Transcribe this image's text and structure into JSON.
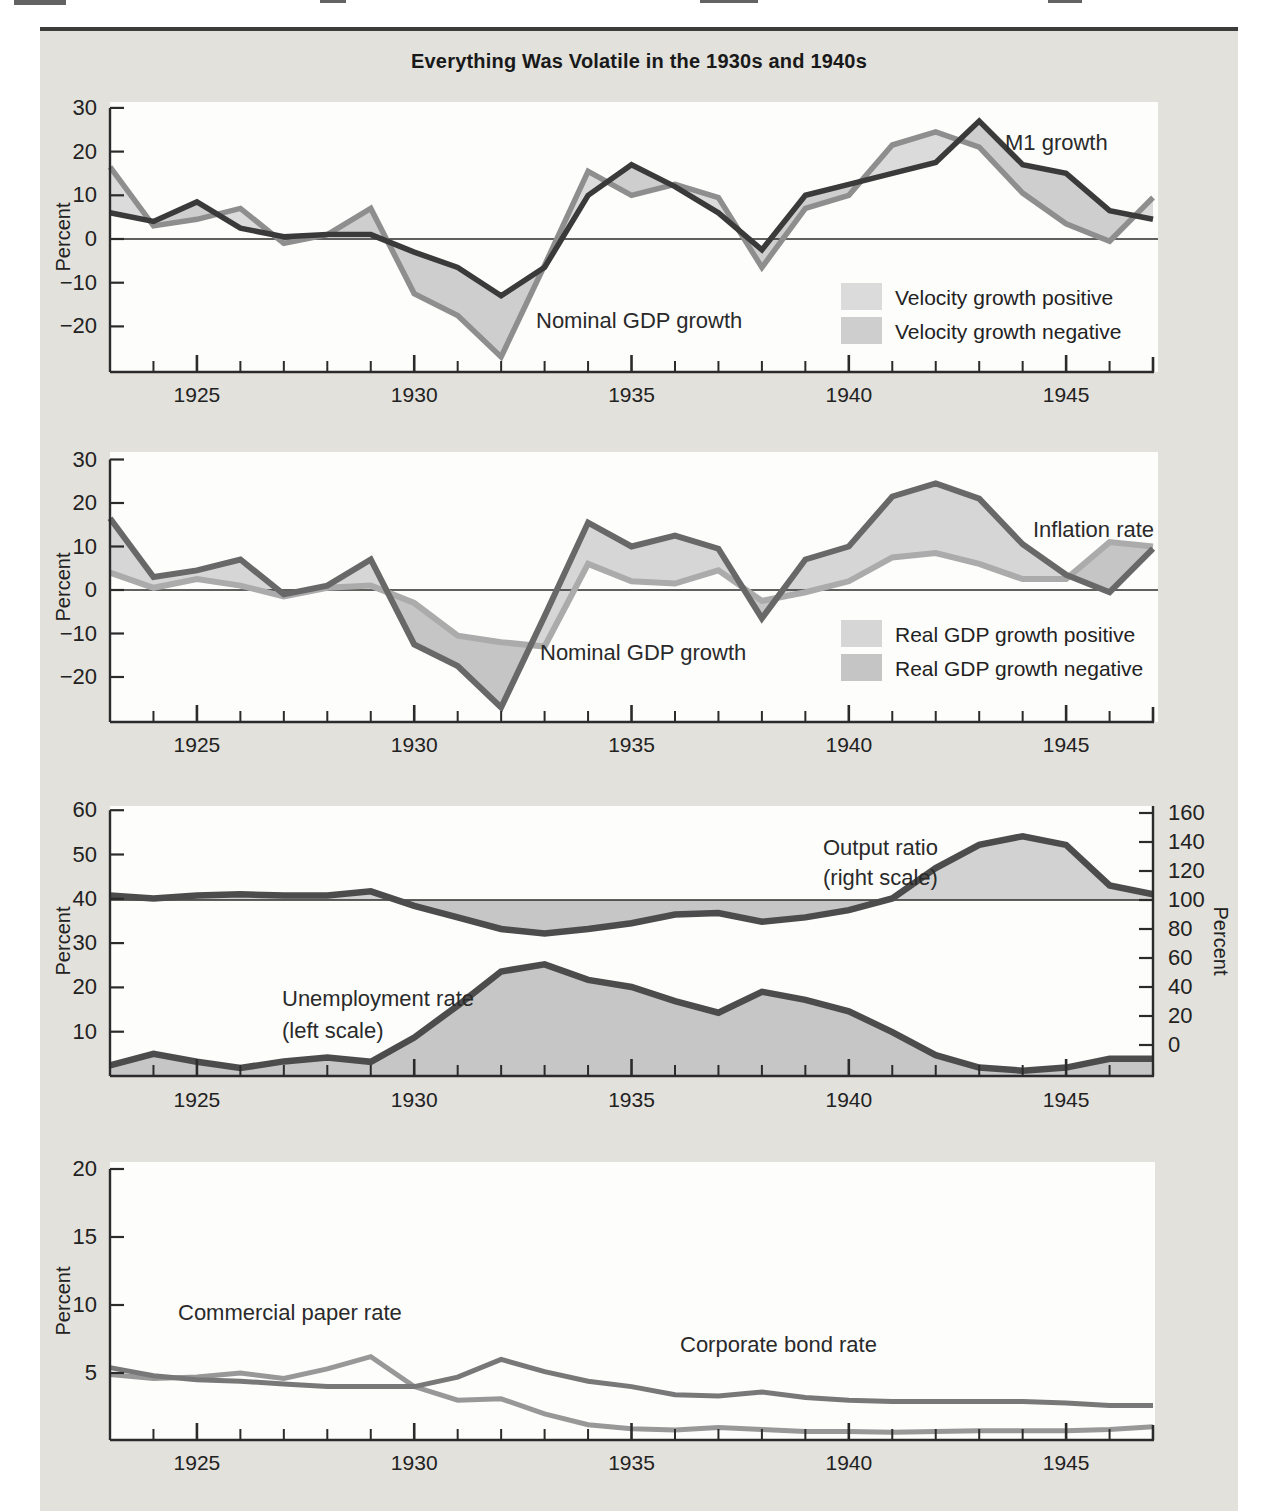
{
  "figure": {
    "title": "Everything Was Volatile in the 1930s and 1940s"
  },
  "chart_data": [
    {
      "id": "money_and_velocity",
      "type": "line",
      "ylabel": "Percent",
      "ylim": [
        -30,
        32
      ],
      "grid": false,
      "x": [
        1923,
        1924,
        1925,
        1926,
        1927,
        1928,
        1929,
        1930,
        1931,
        1932,
        1933,
        1934,
        1935,
        1936,
        1937,
        1938,
        1939,
        1940,
        1941,
        1942,
        1943,
        1944,
        1945,
        1946,
        1947
      ],
      "x_major_ticks": [
        1925,
        1930,
        1935,
        1940,
        1945
      ],
      "x_tick_labels": [
        "1925",
        "1930",
        "1935",
        "1940",
        "1945"
      ],
      "y_ticks": [
        30,
        20,
        10,
        0,
        -10,
        -20
      ],
      "y_tick_labels": [
        "30",
        "20",
        "10",
        "0",
        "−10",
        "−20"
      ],
      "series": [
        {
          "name": "M1 growth",
          "color": "#3a3a3a",
          "values": [
            6,
            4,
            8.5,
            2.5,
            0.5,
            1,
            1,
            -3,
            -6.5,
            -13,
            -6.5,
            10,
            17,
            12,
            6,
            -2.5,
            10,
            12.5,
            15,
            17.5,
            27,
            17,
            15,
            6.5,
            4.5
          ]
        },
        {
          "name": "Nominal GDP growth",
          "color": "#8e8e8e",
          "values": [
            16.5,
            3,
            4.5,
            7,
            -1,
            1,
            7,
            -12.5,
            -17.5,
            -27,
            -6,
            15.5,
            10,
            12.5,
            9.5,
            -6.5,
            7,
            10,
            21.5,
            24.5,
            21,
            10.5,
            3.5,
            -0.5,
            9.5
          ]
        }
      ],
      "fill_between": {
        "a": "Nominal GDP growth",
        "b": "M1 growth",
        "meaning": "velocity growth",
        "positive_color": "#dbdbdb",
        "negative_color": "#cecece"
      },
      "legend": [
        {
          "label": "Velocity growth positive",
          "color": "#dbdbdb"
        },
        {
          "label": "Velocity growth negative",
          "color": "#cecece"
        }
      ],
      "annotations": [
        {
          "text": "M1 growth",
          "x": 1005,
          "y": 150
        },
        {
          "text": "Nominal GDP growth",
          "x": 536,
          "y": 328
        }
      ]
    },
    {
      "id": "nominal_gdp_and_inflation",
      "type": "line",
      "ylabel": "Percent",
      "ylim": [
        -30,
        32
      ],
      "grid": false,
      "x": [
        1923,
        1924,
        1925,
        1926,
        1927,
        1928,
        1929,
        1930,
        1931,
        1932,
        1933,
        1934,
        1935,
        1936,
        1937,
        1938,
        1939,
        1940,
        1941,
        1942,
        1943,
        1944,
        1945,
        1946,
        1947
      ],
      "x_major_ticks": [
        1925,
        1930,
        1935,
        1940,
        1945
      ],
      "x_tick_labels": [
        "1925",
        "1930",
        "1935",
        "1940",
        "1945"
      ],
      "y_ticks": [
        30,
        20,
        10,
        0,
        -10,
        -20
      ],
      "y_tick_labels": [
        "30",
        "20",
        "10",
        "0",
        "−10",
        "−20"
      ],
      "series": [
        {
          "name": "Nominal GDP growth",
          "color": "#686868",
          "values": [
            16.5,
            3,
            4.5,
            7,
            -1,
            1,
            7,
            -12.5,
            -17.5,
            -27,
            -6,
            15.5,
            10,
            12.5,
            9.5,
            -6.5,
            7,
            10,
            21.5,
            24.5,
            21,
            10.5,
            3.5,
            -0.5,
            9.5
          ]
        },
        {
          "name": "Inflation rate",
          "color": "#ababab",
          "values": [
            4,
            0.5,
            2.5,
            1,
            -1.5,
            0.5,
            1,
            -3,
            -10.5,
            -12,
            -13,
            6,
            2,
            1.5,
            4.5,
            -2.5,
            -0.5,
            2,
            7.5,
            8.5,
            6,
            2.5,
            2.5,
            11,
            10
          ]
        }
      ],
      "fill_between": {
        "a": "Nominal GDP growth",
        "b": "Inflation rate",
        "meaning": "real GDP growth",
        "positive_color": "#d6d6d6",
        "negative_color": "#c5c5c5"
      },
      "legend": [
        {
          "label": "Real GDP growth positive",
          "color": "#d6d6d6"
        },
        {
          "label": "Real GDP growth negative",
          "color": "#c5c5c5"
        }
      ],
      "annotations": [
        {
          "text": "Inflation rate",
          "x": 1033,
          "y": 537
        },
        {
          "text": "Nominal GDP growth",
          "x": 540,
          "y": 660
        }
      ]
    },
    {
      "id": "output_ratio_and_unemployment",
      "type": "line",
      "left_ylabel": "Percent",
      "right_ylabel": "Percent",
      "left_ylim": [
        0,
        61
      ],
      "right_ylim": [
        -17,
        167
      ],
      "grid": false,
      "x": [
        1923,
        1924,
        1925,
        1926,
        1927,
        1928,
        1929,
        1930,
        1931,
        1932,
        1933,
        1934,
        1935,
        1936,
        1937,
        1938,
        1939,
        1940,
        1941,
        1942,
        1943,
        1944,
        1945,
        1946,
        1947
      ],
      "x_major_ticks": [
        1925,
        1930,
        1935,
        1940,
        1945
      ],
      "x_tick_labels": [
        "1925",
        "1930",
        "1935",
        "1940",
        "1945"
      ],
      "left_y_ticks": [
        60,
        50,
        40,
        30,
        20,
        10
      ],
      "left_y_tick_labels": [
        "60",
        "50",
        "40",
        "30",
        "20",
        "10"
      ],
      "right_y_ticks": [
        160,
        140,
        120,
        100,
        80,
        60,
        40,
        20,
        0
      ],
      "right_y_tick_labels": [
        "160",
        "140",
        "120",
        "100",
        "80",
        "60",
        "40",
        "20",
        "0"
      ],
      "reference_line_right_value": 100,
      "series": [
        {
          "name": "Output ratio (right scale)",
          "axis": "right",
          "color": "#4c4c4c",
          "fill_above_color": "#d2d2d2",
          "fill_below_color": "#c6c6c6",
          "values": [
            103,
            101,
            103,
            104,
            103,
            103,
            106,
            96,
            88,
            80,
            77,
            80,
            84,
            90,
            91,
            85,
            88,
            93,
            101,
            122,
            138,
            144,
            138,
            110,
            104
          ]
        },
        {
          "name": "Unemployment rate (left scale)",
          "axis": "left",
          "color": "#4c4c4c",
          "area_fill_color": "#c6c6c6",
          "values": [
            2.4,
            5,
            3.2,
            1.8,
            3.3,
            4.2,
            3.2,
            8.7,
            15.9,
            23.6,
            25.2,
            21.7,
            20.1,
            16.9,
            14.3,
            19,
            17.2,
            14.6,
            9.9,
            4.7,
            1.9,
            1.2,
            1.9,
            3.9,
            3.9
          ]
        }
      ],
      "annotations": [
        {
          "text": "Output ratio",
          "x": 823,
          "y": 855
        },
        {
          "text": "(right scale)",
          "x": 823,
          "y": 885
        },
        {
          "text": "Unemployment rate",
          "x": 282,
          "y": 1006
        },
        {
          "text": "(left scale)",
          "x": 282,
          "y": 1038
        }
      ]
    },
    {
      "id": "interest_rates",
      "type": "line",
      "ylabel": "Percent",
      "ylim": [
        0,
        20.8
      ],
      "grid": false,
      "x": [
        1923,
        1924,
        1925,
        1926,
        1927,
        1928,
        1929,
        1930,
        1931,
        1932,
        1933,
        1934,
        1935,
        1936,
        1937,
        1938,
        1939,
        1940,
        1941,
        1942,
        1943,
        1944,
        1945,
        1946,
        1947
      ],
      "x_major_ticks": [
        1925,
        1930,
        1935,
        1940,
        1945
      ],
      "x_tick_labels": [
        "1925",
        "1930",
        "1935",
        "1940",
        "1945"
      ],
      "y_ticks": [
        20,
        15,
        10,
        5
      ],
      "y_tick_labels": [
        "20",
        "15",
        "10",
        "5"
      ],
      "series": [
        {
          "name": "Commercial paper rate",
          "color": "#989898",
          "values": [
            4.9,
            4.6,
            4.7,
            5.0,
            4.6,
            5.3,
            6.2,
            4.0,
            3.0,
            3.1,
            2.0,
            1.2,
            0.9,
            0.8,
            1.0,
            0.85,
            0.7,
            0.7,
            0.65,
            0.7,
            0.75,
            0.75,
            0.75,
            0.85,
            1.05
          ]
        },
        {
          "name": "Corporate bond rate",
          "color": "#787878",
          "values": [
            5.4,
            4.8,
            4.5,
            4.4,
            4.2,
            4.0,
            4.0,
            4.0,
            4.7,
            6.0,
            5.1,
            4.4,
            4.0,
            3.4,
            3.3,
            3.6,
            3.2,
            3.0,
            2.9,
            2.9,
            2.9,
            2.9,
            2.8,
            2.6,
            2.6
          ]
        }
      ],
      "annotations": [
        {
          "text": "Commercial paper rate",
          "x": 178,
          "y": 1320
        },
        {
          "text": "Corporate bond rate",
          "x": 680,
          "y": 1352
        }
      ]
    }
  ],
  "colors": {
    "page_background": "#ffffff",
    "panel_background": "#e2e1dc",
    "plot_background": "#fdfdfc",
    "axis": "#2b2b2b",
    "text": "#222222",
    "top_rule": "#3c3c3c"
  }
}
